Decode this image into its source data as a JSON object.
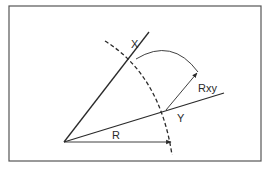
{
  "diagram": {
    "labels": {
      "x": "X",
      "y": "Y",
      "r": "R",
      "rxy": "Rxy"
    },
    "colors": {
      "stroke": "#2a2a2a",
      "border": "#555555",
      "background": "#ffffff"
    }
  }
}
